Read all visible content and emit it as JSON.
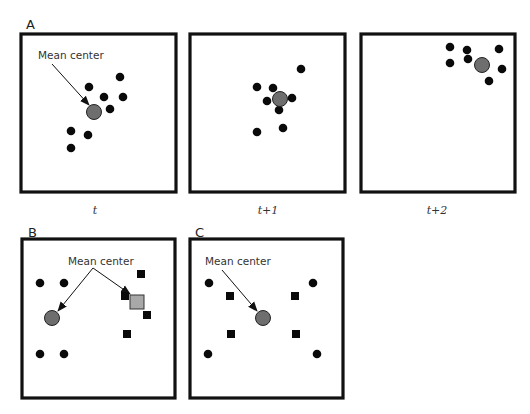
{
  "figure": {
    "panel_A": {
      "letter": "A",
      "callout": "Mean center",
      "frames": [
        {
          "time_label": "t",
          "points": [
            [
              120,
              77
            ],
            [
              89,
              87
            ],
            [
              104,
              97
            ],
            [
              123,
              97
            ],
            [
              110,
              109
            ],
            [
              71,
              131
            ],
            [
              88,
              135
            ],
            [
              71,
              148
            ]
          ],
          "mean_center": [
            94,
            112
          ]
        },
        {
          "time_label": "t+1",
          "points": [
            [
              301,
              69
            ],
            [
              257,
              87
            ],
            [
              273,
              88
            ],
            [
              267,
              101
            ],
            [
              292,
              98
            ],
            [
              279,
              110
            ],
            [
              283,
              128
            ],
            [
              257,
              132
            ]
          ],
          "mean_center": [
            280,
            99
          ]
        },
        {
          "time_label": "t+2",
          "points": [
            [
              450,
              47
            ],
            [
              467,
              50
            ],
            [
              499,
              49
            ],
            [
              450,
              63
            ],
            [
              468,
              59
            ],
            [
              502,
              69
            ],
            [
              489,
              81
            ]
          ],
          "mean_center": [
            482,
            65
          ]
        }
      ]
    },
    "panel_B": {
      "letter": "B",
      "callout": "Mean center",
      "circle_points": [
        [
          40,
          283
        ],
        [
          64,
          283
        ],
        [
          40,
          354
        ],
        [
          64,
          354
        ]
      ],
      "circle_mean_center": [
        52,
        318
      ],
      "square_points": [
        [
          141,
          274
        ],
        [
          125,
          296
        ],
        [
          147,
          315
        ],
        [
          127,
          334
        ]
      ],
      "square_mean_center": [
        137,
        302
      ]
    },
    "panel_C": {
      "letter": "C",
      "callout": "Mean center",
      "circle_points": [
        [
          209,
          283
        ],
        [
          313,
          283
        ],
        [
          208,
          354
        ],
        [
          317,
          354
        ]
      ],
      "square_points": [
        [
          230,
          296
        ],
        [
          295,
          296
        ],
        [
          231,
          334
        ],
        [
          296,
          334
        ]
      ],
      "mean_center": [
        263,
        318
      ]
    },
    "colors": {
      "point": "#0a0a0a",
      "mean_center_circle": "#6e6e6e",
      "mean_center_square": "#a8a8a8",
      "frame": "#111111"
    }
  }
}
